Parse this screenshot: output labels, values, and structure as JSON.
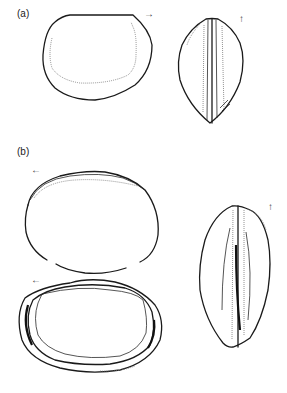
{
  "figure": {
    "panels": [
      {
        "label": "(a)",
        "views": [
          {
            "name": "valve-view",
            "orientation_arrow": "→"
          },
          {
            "name": "girdle-view",
            "orientation_arrow": "↑"
          }
        ]
      },
      {
        "label": "(b)",
        "views": [
          {
            "name": "valve-view-outline",
            "orientation_arrow": "←"
          },
          {
            "name": "valve-view-layered",
            "orientation_arrow": "←"
          },
          {
            "name": "girdle-view",
            "orientation_arrow": "↑"
          }
        ]
      }
    ]
  }
}
